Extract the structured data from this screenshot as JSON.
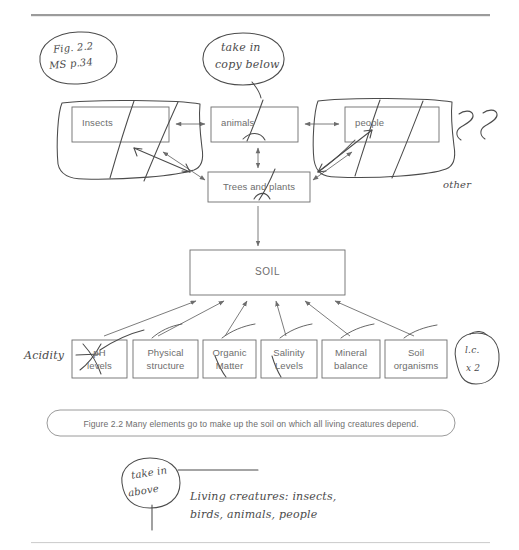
{
  "page": {
    "background_color": "#ffffff",
    "ink_color": "#6d6d6d",
    "hand_ink_color": "#4b4b4b",
    "top_rule": "horizontal-rule",
    "bottom_rule": "horizontal-rule"
  },
  "annotations": {
    "fig_ref": {
      "line1": "Fig. 2.2",
      "line2": "MS p.34",
      "shape": "ellipse"
    },
    "take_in_copy": {
      "line1": "take in",
      "line2": "copy below",
      "shape": "ellipse"
    },
    "take_in_above": {
      "line1": "take in",
      "line2": "above",
      "shape": "circle"
    },
    "other_label": "other",
    "acidity_label": "Acidity",
    "lc_note": {
      "line1": "l.c.",
      "line2": "x 2",
      "shape": "circle"
    },
    "living_creatures": {
      "line1": "Living creatures: insects,",
      "line2": "birds, animals, people"
    },
    "marks": {
      "run_on_1": "run-on-mark",
      "run_on_2": "run-on-mark",
      "strike_ph": "strikethrough-ph",
      "caret_animals": "caret-insert-mark",
      "caret_trees": "caret-insert-mark",
      "lowercase_matter": "lowercase-slash-mark",
      "lowercase_levels": "lowercase-slash-mark"
    }
  },
  "diagram": {
    "top_row": [
      {
        "id": "insects",
        "label": "Insects"
      },
      {
        "id": "animals",
        "label": "animals"
      },
      {
        "id": "people",
        "label": "people"
      }
    ],
    "trees_box": {
      "id": "trees",
      "label": "Trees and plants"
    },
    "soil_box": {
      "id": "soil",
      "label": "SOIL"
    },
    "element_boxes": [
      {
        "id": "ph",
        "line1": "pH",
        "line2": "levels"
      },
      {
        "id": "physical",
        "line1": "Physical",
        "line2": "structure"
      },
      {
        "id": "organic",
        "line1": "Organic",
        "line2": "Matter"
      },
      {
        "id": "salinity",
        "line1": "Salinity",
        "line2": "Levels"
      },
      {
        "id": "mineral",
        "line1": "Mineral",
        "line2": "balance"
      },
      {
        "id": "organisms",
        "line1": "Soil",
        "line2": "organisms"
      }
    ],
    "caption": "Figure 2.2 Many elements go to make up the soil on which all living creatures depend."
  }
}
